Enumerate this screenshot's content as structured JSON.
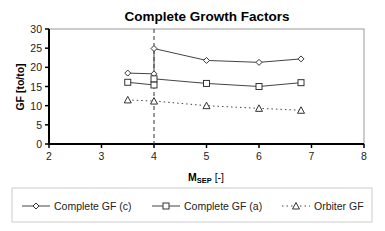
{
  "chart_data": {
    "type": "line",
    "title": "Complete Growth Factors",
    "xlabel": "M_SEP [-]",
    "xlabel_main": "M",
    "xlabel_sub": "SEP",
    "xlabel_unit": " [-]",
    "ylabel": "GF [to/to]",
    "xlim": [
      2,
      8
    ],
    "ylim": [
      0,
      30
    ],
    "xticks": [
      2,
      3,
      4,
      5,
      6,
      7,
      8
    ],
    "yticks": [
      0,
      5,
      10,
      15,
      20,
      25,
      30
    ],
    "grid": false,
    "legend_position": "bottom",
    "annotations": [
      {
        "type": "vertical-dashed-line",
        "x": 4
      }
    ],
    "series": [
      {
        "name": "Complete GF (c)",
        "marker": "diamond",
        "line": "solid",
        "x": [
          3.5,
          4,
          4,
          5,
          6,
          6.8
        ],
        "y": [
          18.5,
          18.3,
          24.9,
          21.8,
          21.3,
          22.2
        ]
      },
      {
        "name": "Complete GF (a)",
        "marker": "square",
        "line": "solid",
        "x": [
          3.5,
          4,
          4,
          5,
          6,
          6.8
        ],
        "y": [
          16.1,
          15.4,
          17.0,
          15.8,
          15.0,
          16.0
        ]
      },
      {
        "name": "Orbiter GF",
        "marker": "triangle",
        "line": "dotted",
        "x": [
          3.5,
          4,
          5,
          6,
          6.8
        ],
        "y": [
          11.5,
          11.2,
          10.0,
          9.3,
          8.8
        ]
      }
    ]
  }
}
